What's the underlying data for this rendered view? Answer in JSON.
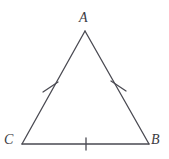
{
  "figure": {
    "name": "triangle-abc",
    "type": "geometry-diagram",
    "background_color": "#ffffff",
    "stroke_color": "#4a4a52",
    "label_color": "#3b3b42",
    "stroke_width": 1.3
  },
  "vertices": [
    {
      "id": "A",
      "label": "A",
      "x": 85,
      "y": 31,
      "label_x": 79,
      "label_y": 11,
      "position": "apex"
    },
    {
      "id": "C",
      "label": "C",
      "x": 22,
      "y": 144,
      "label_x": 4,
      "label_y": 133,
      "position": "bottom-left"
    },
    {
      "id": "B",
      "label": "B",
      "x": 149,
      "y": 144,
      "label_x": 151,
      "label_y": 133,
      "position": "bottom-right"
    }
  ],
  "sides": [
    {
      "id": "AC",
      "from": "A",
      "to": "C",
      "x1": 85,
      "y1": 31,
      "x2": 22,
      "y2": 144,
      "tick_count": 1
    },
    {
      "id": "AB",
      "from": "A",
      "to": "B",
      "x1": 85,
      "y1": 31,
      "x2": 149,
      "y2": 144,
      "tick_count": 1
    },
    {
      "id": "CB",
      "from": "C",
      "to": "B",
      "x1": 22,
      "y1": 144,
      "x2": 149,
      "y2": 144,
      "tick_count": 1
    }
  ],
  "tick_marks": [
    {
      "id": "tick-AC",
      "side": "AC",
      "cx": 50,
      "cy": 87,
      "x1": 43,
      "y1": 92,
      "x2": 58,
      "y2": 82
    },
    {
      "id": "tick-AB",
      "side": "AB",
      "cx": 118,
      "cy": 86,
      "x1": 111,
      "y1": 81,
      "x2": 126,
      "y2": 91
    },
    {
      "id": "tick-CB",
      "side": "CB",
      "cx": 86,
      "cy": 144,
      "x1": 86,
      "y1": 138,
      "x2": 86,
      "y2": 150
    }
  ]
}
